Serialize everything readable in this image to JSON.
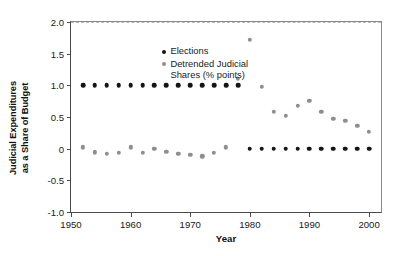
{
  "chart_data": {
    "type": "scatter",
    "title": "",
    "xlabel": "Year",
    "ylabel": "Judicial Expenditures\nas a Share of Budget",
    "ylabel_line1": "Judicial Expenditures",
    "ylabel_line2": "as a Share of Budget",
    "xlim": [
      1950,
      2002
    ],
    "ylim": [
      -1.0,
      2.0
    ],
    "xticks": [
      1950,
      1960,
      1970,
      1980,
      1990,
      2000
    ],
    "xticklabels": [
      "1950",
      "1960",
      "1970",
      "1980",
      "1990",
      "2000"
    ],
    "yticks": [
      -1.0,
      -0.5,
      0,
      0.5,
      1.0,
      1.5,
      2.0
    ],
    "yticklabels": [
      "-1.0",
      "-0.5",
      "0",
      "0.5",
      "1.0",
      "1.5",
      "2.0"
    ],
    "grid": false,
    "reference_line": 0,
    "legend_position": "upper-left-inside",
    "series": [
      {
        "name": "Elections",
        "key": "elections",
        "color": "#151515",
        "marker": "circle",
        "marker_size": 4.6,
        "x": [
          1952,
          1954,
          1956,
          1958,
          1960,
          1962,
          1964,
          1966,
          1968,
          1970,
          1972,
          1974,
          1976,
          1978,
          1980,
          1982,
          1984,
          1986,
          1988,
          1990,
          1992,
          1994,
          1996,
          1998,
          2000
        ],
        "y": [
          1.0,
          1.0,
          1.0,
          1.0,
          1.0,
          1.0,
          1.0,
          1.0,
          1.0,
          1.0,
          1.0,
          1.0,
          1.0,
          1.0,
          0.0,
          0.0,
          0.0,
          0.0,
          0.0,
          0.0,
          0.0,
          0.0,
          0.0,
          0.0,
          0.0
        ]
      },
      {
        "name": "Detrended Judicial Shares (% points)",
        "key": "detrended",
        "color": "#8e8e8e",
        "marker": "circle",
        "marker_size": 4.4,
        "x": [
          1952,
          1954,
          1956,
          1958,
          1960,
          1962,
          1964,
          1966,
          1968,
          1970,
          1972,
          1974,
          1976,
          1978,
          1980,
          1982,
          1984,
          1986,
          1988,
          1990,
          1992,
          1994,
          1996,
          1998,
          2000
        ],
        "y": [
          0.02,
          -0.06,
          -0.08,
          -0.07,
          0.02,
          -0.07,
          0.0,
          -0.05,
          -0.08,
          -0.1,
          -0.12,
          -0.07,
          0.02,
          1.1,
          1.72,
          0.98,
          0.58,
          0.52,
          0.68,
          0.76,
          0.58,
          0.47,
          0.44,
          0.36,
          0.27
        ]
      }
    ],
    "legend": [
      {
        "label": "Elections",
        "color": "#151515"
      },
      {
        "label": "Detrended Judicial Shares (% points)",
        "color": "#8e8e8e",
        "label_line1": "Detrended Judicial",
        "label_line2": "Shares (% points)"
      }
    ]
  }
}
